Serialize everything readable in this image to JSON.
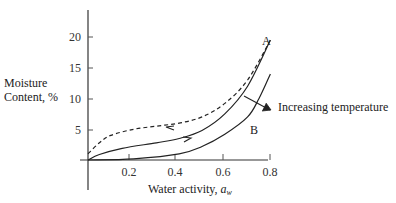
{
  "chart_data": {
    "type": "line",
    "title": "",
    "xlabel": "Water activity, a_w",
    "xlabel_main": "Water activity, ",
    "xlabel_sym": "a",
    "xlabel_sub": "w",
    "ylabel_line1": "Moisture",
    "ylabel_line2": "Content, %",
    "ylabel": "Moisture Content, %",
    "xlim": [
      0,
      0.85
    ],
    "ylim": [
      -4,
      24
    ],
    "x_ticks": [
      0.2,
      0.4,
      0.6,
      0.8
    ],
    "x_tick_labels": [
      "0.2",
      "0.4",
      "0.6",
      "0.8"
    ],
    "y_ticks": [
      5,
      10,
      15,
      20
    ],
    "y_tick_labels": [
      "5",
      "10",
      "15",
      "20"
    ],
    "grid": false,
    "legend": "none",
    "series": [
      {
        "name": "Desorption (curve A, dashed)",
        "style": "dashed",
        "x": [
          0.0,
          0.05,
          0.1,
          0.2,
          0.3,
          0.4,
          0.5,
          0.6,
          0.7,
          0.8
        ],
        "y": [
          1.0,
          2.8,
          4.0,
          5.0,
          5.5,
          6.0,
          7.0,
          9.2,
          13.0,
          19.5
        ]
      },
      {
        "name": "Adsorption (curve A, solid)",
        "style": "solid",
        "x": [
          0.0,
          0.05,
          0.15,
          0.3,
          0.4,
          0.5,
          0.6,
          0.7,
          0.8
        ],
        "y": [
          0.0,
          0.9,
          1.9,
          2.8,
          3.5,
          4.8,
          7.5,
          12.0,
          19.5
        ]
      },
      {
        "name": "Curve B (higher temperature)",
        "style": "solid",
        "x": [
          0.0,
          0.2,
          0.4,
          0.5,
          0.6,
          0.7,
          0.75,
          0.8
        ],
        "y": [
          0.0,
          0.2,
          1.0,
          2.2,
          4.2,
          7.0,
          10.0,
          14.0
        ]
      }
    ],
    "annotations": [
      {
        "text": "A",
        "x": 0.79,
        "y": 20.5
      },
      {
        "text": "B",
        "x": 0.68,
        "y": 2.5
      },
      {
        "text": "Increasing temperature",
        "x": 0.86,
        "y": 9.5
      },
      {
        "text": "arrow-left-on-desorption",
        "x": 0.38,
        "y": 5.9
      },
      {
        "text": "arrow-right-on-adsorption",
        "x": 0.43,
        "y": 3.6
      }
    ]
  },
  "labels": {
    "curve_a": "A",
    "curve_b": "B",
    "increasing_temperature": "Increasing temperature"
  }
}
